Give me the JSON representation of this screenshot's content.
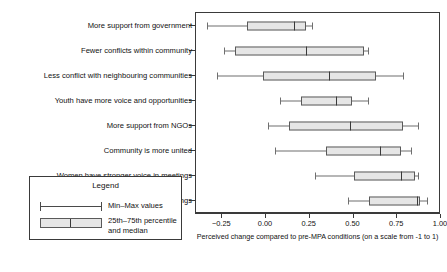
{
  "chart_data": {
    "type": "boxplot",
    "title": "",
    "xlabel": "Perceived change compared to pre-MPA conditions (on a scale from -1 to 1)",
    "ylabel": "",
    "xlim": [
      -0.4,
      1.0
    ],
    "xticks": [
      -0.25,
      0.0,
      0.25,
      0.5,
      0.75,
      1.0
    ],
    "xticklabels": [
      "−0.25",
      "0.00",
      "0.25",
      "0.50",
      "0.75",
      "1.00"
    ],
    "grid": false,
    "legend_position": "outside-bottom-left",
    "orientation": "horizontal",
    "categories": [
      "More support from government",
      "Fewer conflicts within community",
      "Less conflict with neighbouring communities",
      "Youth have more voice and opportunities",
      "More support from NGOs",
      "Community is more united",
      "Women have stronger voice in meetings",
      "More participation in community meetings"
    ],
    "boxes": [
      {
        "category": "More support from government",
        "min": -0.34,
        "q1": -0.11,
        "median": 0.16,
        "q3": 0.23,
        "max": 0.26
      },
      {
        "category": "Fewer conflicts within community",
        "min": -0.24,
        "q1": -0.18,
        "median": 0.23,
        "q3": 0.56,
        "max": 0.58
      },
      {
        "category": "Less conflict with neighbouring communities",
        "min": -0.28,
        "q1": -0.02,
        "median": 0.36,
        "q3": 0.63,
        "max": 0.78
      },
      {
        "category": "Youth have more voice and opportunities",
        "min": 0.08,
        "q1": 0.2,
        "median": 0.4,
        "q3": 0.49,
        "max": 0.58
      },
      {
        "category": "More support from NGOs",
        "min": 0.01,
        "q1": 0.13,
        "median": 0.48,
        "q3": 0.78,
        "max": 0.87
      },
      {
        "category": "Community is more united",
        "min": 0.05,
        "q1": 0.34,
        "median": 0.65,
        "q3": 0.77,
        "max": 0.83
      },
      {
        "category": "Women have stronger voice in meetings",
        "min": 0.28,
        "q1": 0.5,
        "median": 0.77,
        "q3": 0.85,
        "max": 0.87
      },
      {
        "category": "More participation in community meetings",
        "min": 0.47,
        "q1": 0.59,
        "median": 0.86,
        "q3": 0.88,
        "max": 0.92
      }
    ]
  },
  "legend": {
    "title": "Legend",
    "minmax_label": "Min–Max values",
    "box_label": "25th–75th percentile and median"
  },
  "colors": {
    "box_fill": "#e6e6e6",
    "box_border": "#5a5a5a",
    "whisker": "#6f6f6f",
    "median": "#3a3a3a",
    "frame": "#3a3a3a",
    "text": "#111111",
    "background": "#ffffff"
  }
}
